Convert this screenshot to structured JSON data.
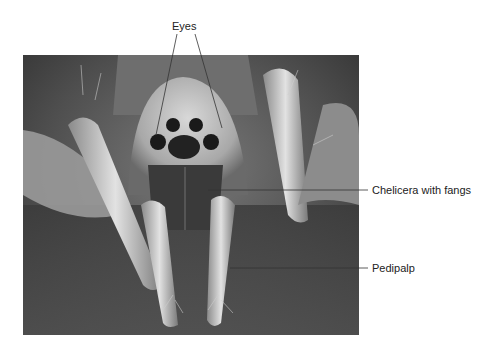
{
  "figure": {
    "labels": [
      {
        "id": "eyes",
        "text": "Eyes"
      },
      {
        "id": "chelicera",
        "text": "Chelicera with fangs"
      },
      {
        "id": "pedipalp",
        "text": "Pedipalp"
      }
    ]
  },
  "colors": {
    "background": "#ffffff",
    "photo_bg": "#5a5a5a",
    "leader_line": "#333333",
    "label_text": "#222222"
  }
}
